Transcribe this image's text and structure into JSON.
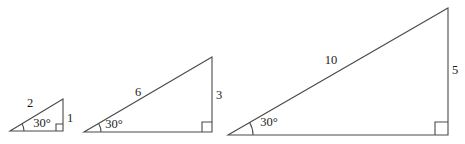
{
  "diagram": {
    "background_color": "#ffffff",
    "line_color": "#4a4a4a",
    "text_color": "#1c1c1c",
    "width": 465,
    "height": 144,
    "triangles": [
      {
        "name": "small",
        "vertices": {
          "left": [
            10,
            131
          ],
          "bottom_right": [
            63,
            131
          ],
          "top": [
            63,
            99
          ]
        },
        "labels": {
          "hypotenuse": "2",
          "angle": "30°",
          "opposite_side": "1"
        },
        "label_positions": {
          "hypotenuse": [
            30,
            107
          ],
          "angle": [
            42,
            127
          ],
          "opposite_side": [
            70,
            122
          ]
        },
        "right_angle_mark_size": 7,
        "angle_arc_radius": 14
      },
      {
        "name": "medium",
        "vertices": {
          "left": [
            84,
            132
          ],
          "bottom_right": [
            212,
            132
          ],
          "top": [
            212,
            57
          ]
        },
        "labels": {
          "hypotenuse": "6",
          "angle": "30°",
          "opposite_side": "3"
        },
        "label_positions": {
          "hypotenuse": [
            138,
            96
          ],
          "angle": [
            114,
            128
          ],
          "opposite_side": [
            219,
            99
          ]
        },
        "right_angle_mark_size": 10,
        "angle_arc_radius": 17
      },
      {
        "name": "large",
        "vertices": {
          "left": [
            228,
            135
          ],
          "bottom_right": [
            448,
            135
          ],
          "top": [
            448,
            8
          ]
        },
        "labels": {
          "hypotenuse": "10",
          "angle": "30°",
          "opposite_side": "5"
        },
        "label_positions": {
          "hypotenuse": [
            331,
            64
          ],
          "angle": [
            269,
            126
          ],
          "opposite_side": [
            455,
            74
          ]
        },
        "right_angle_mark_size": 13,
        "angle_arc_radius": 25
      }
    ]
  }
}
